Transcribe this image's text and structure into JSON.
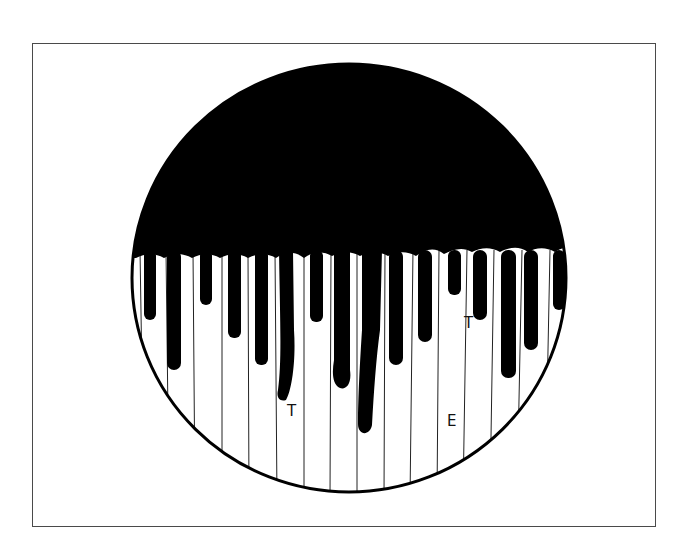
{
  "figure": {
    "labels": [
      {
        "id": "label-t-left",
        "text": "T",
        "x": 287,
        "y": 404
      },
      {
        "id": "label-e",
        "text": "E",
        "x": 447,
        "y": 414
      },
      {
        "id": "label-t-right",
        "text": "T",
        "x": 464,
        "y": 316
      }
    ],
    "colors": {
      "ink": "#000000",
      "background": "#ffffff",
      "frame": "#4a4a4a"
    }
  }
}
